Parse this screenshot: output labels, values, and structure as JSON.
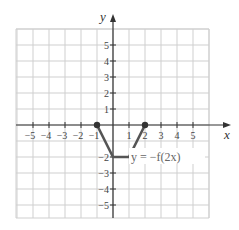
{
  "chart_data": {
    "type": "line",
    "title": "",
    "xlabel": "x",
    "ylabel": "y",
    "xlim": [
      -6,
      6
    ],
    "ylim": [
      -6,
      6
    ],
    "grid": true,
    "x_ticks": [
      -5,
      -4,
      -3,
      -2,
      -1,
      1,
      2,
      3,
      4,
      5
    ],
    "y_ticks": [
      5,
      4,
      3,
      2,
      1,
      -2,
      -3,
      -4,
      -5
    ],
    "x_tick_labels": [
      "−5",
      "−4",
      "−3",
      "−2",
      "−1",
      "1",
      "2",
      "3",
      "4",
      "5"
    ],
    "y_tick_labels": [
      "5",
      "4",
      "3",
      "2",
      "1",
      "−2",
      "−3",
      "−4",
      "−5"
    ],
    "series": [
      {
        "name": "y = −f(2x)",
        "points": [
          [
            -1,
            0
          ],
          [
            0,
            -2
          ],
          [
            1,
            -2
          ],
          [
            2,
            0
          ]
        ],
        "endpoints_marked": [
          [
            -1,
            0
          ],
          [
            2,
            0
          ]
        ],
        "color": "#555555"
      }
    ],
    "annotations": [
      {
        "text": "y = −f(2x)",
        "x": 1.3,
        "y": -2.2
      }
    ]
  },
  "labels": {
    "x_axis": "x",
    "y_axis": "y",
    "equation": "y = −f(2x)"
  }
}
